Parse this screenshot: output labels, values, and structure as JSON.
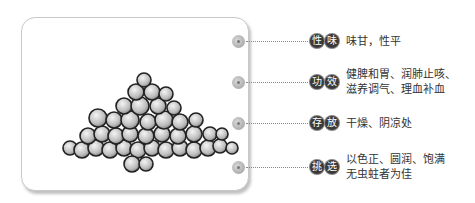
{
  "image": {
    "subject": "pile-of-round-seeds-illustration"
  },
  "items": [
    {
      "badge": [
        "性",
        "味"
      ],
      "lines": [
        "味甘，性平"
      ]
    },
    {
      "badge": [
        "功",
        "效"
      ],
      "lines": [
        "健脾和胃、润肺止咳、",
        "滋养调气、理血补血"
      ]
    },
    {
      "badge": [
        "存",
        "放"
      ],
      "lines": [
        "干燥、阴凉处"
      ]
    },
    {
      "badge": [
        "挑",
        "选"
      ],
      "lines": [
        "以色正、圆润、饱满",
        "无虫蛀者为佳"
      ]
    }
  ]
}
